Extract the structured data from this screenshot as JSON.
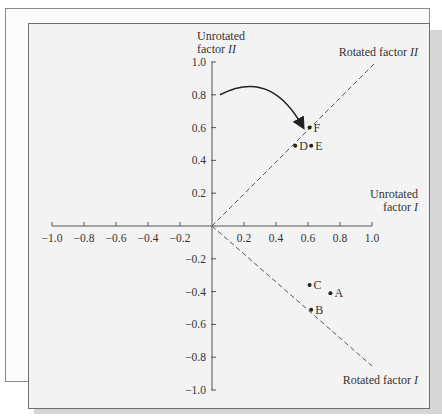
{
  "chart_data": {
    "type": "scatter",
    "title": "",
    "x_axis": {
      "label_line1": "Unrotated",
      "label_line2_prefix": "factor ",
      "label_line2_italic": "I",
      "range": [
        -1.0,
        1.0
      ],
      "ticks": [
        "−1.0",
        "−0.8",
        "−0.6",
        "−0.4",
        "−0.2",
        "0.2",
        "0.4",
        "0.6",
        "0.8",
        "1.0"
      ],
      "tick_values": [
        -1.0,
        -0.8,
        -0.6,
        -0.4,
        -0.2,
        0.2,
        0.4,
        0.6,
        0.8,
        1.0
      ]
    },
    "y_axis": {
      "label_line1": "Unrotated",
      "label_line2_prefix": "factor ",
      "label_line2_italic": "II",
      "range": [
        -1.0,
        1.0
      ],
      "ticks": [
        "1.0",
        "0.8",
        "0.6",
        "0.4",
        "0.2",
        "−0.2",
        "−0.4",
        "−0.6",
        "−0.8",
        "−1.0"
      ],
      "tick_values": [
        1.0,
        0.8,
        0.6,
        0.4,
        0.2,
        -0.2,
        -0.4,
        -0.6,
        -0.8,
        -1.0
      ]
    },
    "rotated_axes": [
      {
        "label_prefix": "Rotated factor ",
        "label_italic": "II",
        "direction": [
          1,
          1
        ],
        "style": "dashed"
      },
      {
        "label_prefix": "Rotated factor ",
        "label_italic": "I",
        "direction": [
          1,
          -1
        ],
        "style": "dashed"
      }
    ],
    "points": [
      {
        "label": "A",
        "x": 0.74,
        "y": -0.41
      },
      {
        "label": "B",
        "x": 0.62,
        "y": -0.51
      },
      {
        "label": "C",
        "x": 0.61,
        "y": -0.36
      },
      {
        "label": "D",
        "x": 0.52,
        "y": 0.49
      },
      {
        "label": "E",
        "x": 0.62,
        "y": 0.49
      },
      {
        "label": "F",
        "x": 0.61,
        "y": 0.6
      }
    ],
    "annotations": [
      {
        "type": "curved-arrow",
        "from": [
          0.05,
          0.8
        ],
        "to": [
          0.56,
          0.6
        ],
        "meaning": "rotation of axes"
      }
    ],
    "grid": false,
    "legend": "none"
  }
}
